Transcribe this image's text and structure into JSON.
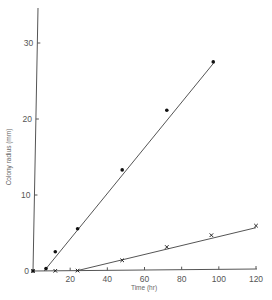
{
  "chart_data": {
    "type": "line",
    "title": "",
    "xlabel": "Time (hr)",
    "ylabel": "Colony radius (mm)",
    "xlim": [
      0,
      120
    ],
    "ylim": [
      0,
      35
    ],
    "x_ticks": [
      0,
      20,
      40,
      60,
      80,
      100,
      120
    ],
    "x_tick_labels": [
      "20",
      "40",
      "60",
      "80",
      "100",
      "120"
    ],
    "y_ticks": [
      0,
      10,
      20,
      30
    ],
    "y_tick_labels": [
      "0",
      "10",
      "20",
      "30"
    ],
    "grid": false,
    "legend": null,
    "series": [
      {
        "name": "filled circles",
        "marker": "dot",
        "x": [
          0,
          7,
          12,
          24,
          48,
          72,
          97
        ],
        "y": [
          0,
          0.3,
          2.5,
          5.5,
          13.2,
          21.0,
          27.3
        ],
        "fit_line": {
          "x": [
            6,
            97
          ],
          "y": [
            0,
            27.3
          ]
        }
      },
      {
        "name": "crosses",
        "marker": "x",
        "x": [
          0,
          12,
          24,
          48,
          72,
          96,
          120
        ],
        "y": [
          0,
          0,
          0,
          1.3,
          3.0,
          4.5,
          5.7
        ],
        "fit_line": {
          "x": [
            23,
            120
          ],
          "y": [
            0,
            5.7
          ]
        }
      }
    ]
  },
  "axes": {
    "x_title": "Time (hr)",
    "y_title": "Colony radius (mm)",
    "y_labels": [
      "0",
      "10",
      "20",
      "30"
    ],
    "x_labels": [
      "20",
      "40",
      "60",
      "80",
      "100",
      "120"
    ]
  },
  "colors": {
    "line": "#555555",
    "marker": "#111111",
    "text": "#555555"
  }
}
